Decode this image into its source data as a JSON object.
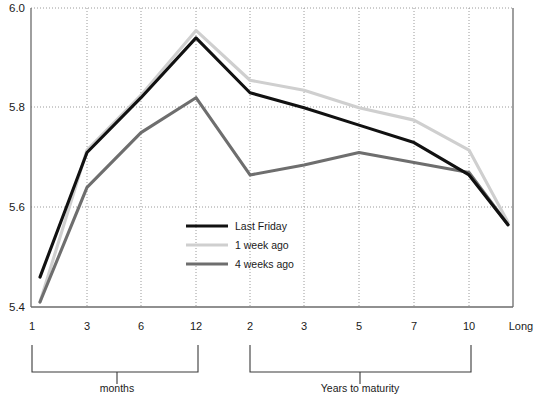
{
  "chart_data": {
    "type": "line",
    "title": "",
    "xlabel": "",
    "ylabel": "",
    "ylim": [
      5.4,
      6.0
    ],
    "yticks": [
      5.4,
      5.6,
      5.8,
      6.0
    ],
    "ytick_labels": [
      "5.4",
      "5.6",
      "5.8",
      "6.0"
    ],
    "grid": true,
    "legend_position": "center",
    "x_categories": [
      "1",
      "3",
      "6",
      "12",
      "2",
      "3",
      "5",
      "7",
      "10",
      "Long"
    ],
    "x_tick_labels": [
      "1",
      "3",
      "6",
      "12",
      "2",
      "3",
      "5",
      "7",
      "10",
      "Long"
    ],
    "group_brackets": [
      {
        "label": "months",
        "from": "1",
        "to": "12"
      },
      {
        "label": "Years to maturity",
        "from": "2",
        "to": "10"
      }
    ],
    "series": [
      {
        "name": "Last Friday",
        "color": "#111111",
        "values": [
          5.46,
          5.71,
          5.82,
          5.94,
          5.83,
          5.8,
          5.765,
          5.73,
          5.665,
          5.565
        ]
      },
      {
        "name": "1 week ago",
        "color": "#cfcfcf",
        "values": [
          5.41,
          5.715,
          5.825,
          5.955,
          5.855,
          5.835,
          5.8,
          5.775,
          5.715,
          5.57
        ]
      },
      {
        "name": "4 weeks ago",
        "color": "#6e6e6e",
        "values": [
          5.41,
          5.64,
          5.75,
          5.82,
          5.665,
          5.685,
          5.71,
          5.69,
          5.67,
          5.565
        ]
      }
    ]
  },
  "legend": {
    "items": [
      {
        "label": "Last Friday",
        "color": "#111111"
      },
      {
        "label": "1 week ago",
        "color": "#cfcfcf"
      },
      {
        "label": "4 weeks ago",
        "color": "#6e6e6e"
      }
    ]
  },
  "axis": {
    "y_tick_labels": [
      "6.0",
      "5.8",
      "5.6",
      "5.4"
    ],
    "x_tick_labels": [
      "1",
      "3",
      "6",
      "12",
      "2",
      "3",
      "5",
      "7",
      "10",
      "Long"
    ]
  },
  "brackets": {
    "months_label": "months",
    "years_label": "Years to maturity"
  }
}
